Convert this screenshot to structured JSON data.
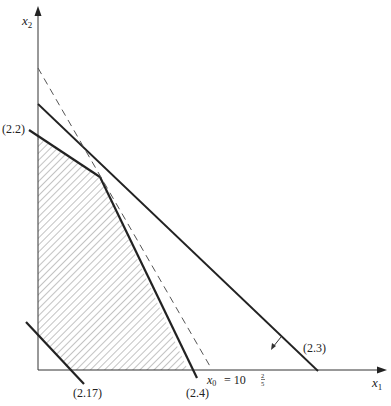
{
  "diagram": {
    "type": "linear-programming-feasible-region",
    "axes": {
      "x_label": "x",
      "x_sub": "1",
      "y_label": "x",
      "y_sub": "2"
    },
    "constraints": [
      {
        "id": "2.2",
        "label": "(2.2)",
        "style": "solid-thick"
      },
      {
        "id": "2.3",
        "label": "(2.3)",
        "style": "solid-thick"
      },
      {
        "id": "2.4",
        "label": "(2.4)",
        "style": "solid-thick"
      },
      {
        "id": "2.17",
        "label": "(2.17)",
        "style": "solid-thick"
      }
    ],
    "objective_line": {
      "style": "dashed",
      "label_var": "x",
      "label_sub": "0",
      "label_eq": "= 10",
      "label_frac_num": "2",
      "label_frac_den": "5"
    },
    "feasible_region": {
      "fill": "hatched"
    },
    "colors": {
      "line": "#222222",
      "dashed": "#555555",
      "hatch": "#777777"
    }
  }
}
